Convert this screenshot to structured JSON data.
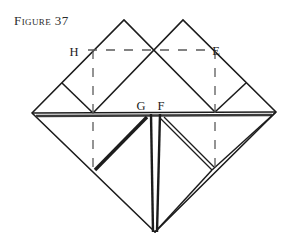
{
  "figure": {
    "caption": "Figure 37",
    "caption_plain": "FIGURE 37",
    "background_color": "#ffffff",
    "ink_color": "#1c1c1c"
  },
  "labels": {
    "H": "H",
    "E": "E",
    "G": "G",
    "F": "F"
  },
  "label_positions": {
    "H": {
      "x": 74,
      "y": 52
    },
    "E": {
      "x": 215,
      "y": 51
    },
    "G": {
      "x": 140,
      "y": 108
    },
    "F": {
      "x": 159,
      "y": 108
    }
  },
  "geometry": {
    "description": "Origami folding diagram: large square rotated 45 degrees with two smaller squares folded up at the top and triangular flaps at the bottom.",
    "vertices": {
      "left": {
        "x": 32,
        "y": 113
      },
      "right": {
        "x": 276,
        "y": 112
      },
      "bottom": {
        "x": 155,
        "y": 232
      },
      "top_left_apex": {
        "x": 124,
        "y": 20
      },
      "top_right_apex": {
        "x": 183,
        "y": 20
      },
      "center_cross": {
        "x": 155,
        "y": 50
      },
      "left_mid": {
        "x": 93,
        "y": 113
      },
      "right_mid": {
        "x": 215,
        "y": 112
      },
      "G": {
        "x": 147,
        "y": 113
      },
      "F": {
        "x": 157,
        "y": 113
      }
    },
    "dashed_lines": [
      {
        "name": "horizontal-HE",
        "x1": 88,
        "y1": 50,
        "x2": 213,
        "y2": 50
      },
      {
        "name": "vertical-left",
        "x1": 93,
        "y1": 50,
        "x2": 93,
        "y2": 170
      },
      {
        "name": "vertical-right",
        "x1": 215,
        "y1": 50,
        "x2": 215,
        "y2": 170
      }
    ]
  }
}
